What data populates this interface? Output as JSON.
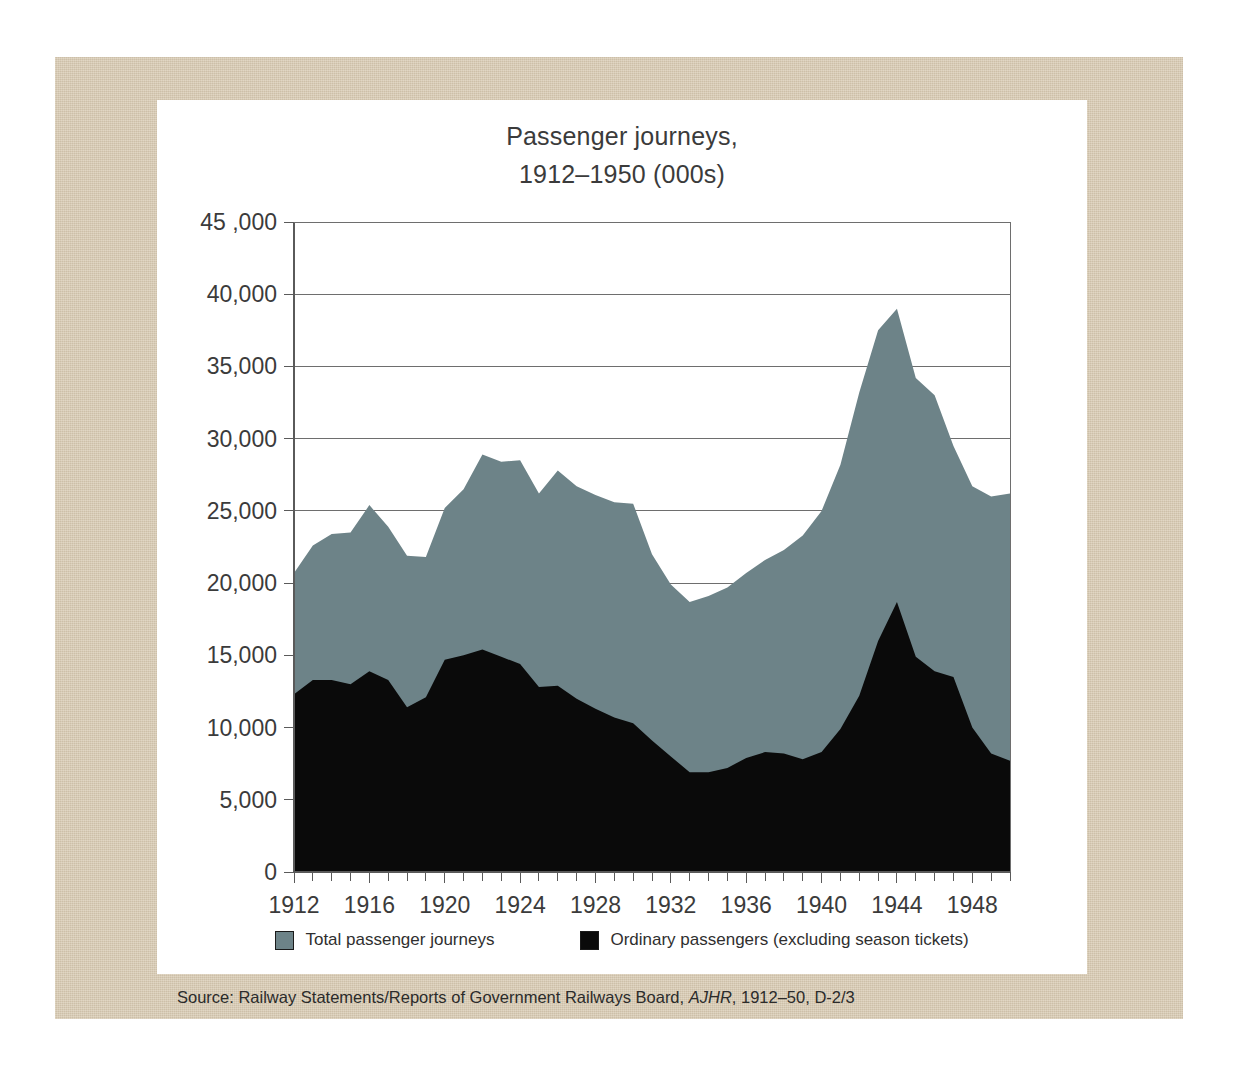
{
  "title": {
    "line1": "Passenger journeys,",
    "line2": "1912–1950 (000s)"
  },
  "source": {
    "prefix": "Source: Railway Statements/Reports of Government Railways Board, ",
    "italic": "AJHR",
    "suffix": ", 1912–50, D-2/3"
  },
  "legend": {
    "total": "Total passenger journeys",
    "ordinary": "Ordinary passengers (excluding season tickets)"
  },
  "colors": {
    "total": "#6d8388",
    "ordinary": "#0a0a0a",
    "mat": "#d9cbb3",
    "panel": "#ffffff",
    "axis": "#5a5a5a",
    "grid": "#6e6e6e",
    "text": "#3b3b3b"
  },
  "chart_data": {
    "type": "area",
    "title": "Passenger journeys, 1912–1950 (000s)",
    "xlabel": "",
    "ylabel": "",
    "units": "thousands of journeys",
    "stacked": false,
    "overlaid": true,
    "grid": true,
    "legend_position": "bottom",
    "xlim": [
      1912,
      1950
    ],
    "ylim": [
      0,
      45000
    ],
    "ytick_labels": [
      "0",
      "5,000",
      "10,000",
      "15,000",
      "20,000",
      "25,000",
      "30,000",
      "35,000",
      "40,000",
      "45 ,000"
    ],
    "yticks": [
      0,
      5000,
      10000,
      15000,
      20000,
      25000,
      30000,
      35000,
      40000,
      45000
    ],
    "xtick_labels": [
      "1912",
      "1916",
      "1920",
      "1924",
      "1928",
      "1932",
      "1936",
      "1940",
      "1944",
      "1948"
    ],
    "xticks": [
      1912,
      1916,
      1920,
      1924,
      1928,
      1932,
      1936,
      1940,
      1944,
      1948
    ],
    "xtick_minor_interval": 1,
    "x": [
      1912,
      1913,
      1914,
      1915,
      1916,
      1917,
      1918,
      1919,
      1920,
      1921,
      1922,
      1923,
      1924,
      1925,
      1926,
      1927,
      1928,
      1929,
      1930,
      1931,
      1932,
      1933,
      1934,
      1935,
      1936,
      1937,
      1938,
      1939,
      1940,
      1941,
      1942,
      1943,
      1944,
      1945,
      1946,
      1947,
      1948,
      1949,
      1950
    ],
    "series": [
      {
        "name": "Total passenger journeys",
        "color": "#6d8388",
        "values": [
          20700,
          22600,
          23400,
          23500,
          25400,
          23900,
          21900,
          21800,
          25200,
          26500,
          28900,
          28400,
          28500,
          26200,
          27800,
          26700,
          26100,
          25600,
          25500,
          22000,
          19900,
          18700,
          19100,
          19700,
          20700,
          21600,
          22300,
          23300,
          25000,
          28200,
          33200,
          37500,
          39000,
          34200,
          33000,
          29500,
          26700,
          26000,
          26200
        ]
      },
      {
        "name": "Ordinary passengers (excluding season tickets)",
        "color": "#0a0a0a",
        "values": [
          12300,
          13300,
          13300,
          13000,
          13900,
          13300,
          11400,
          12100,
          14700,
          15000,
          15400,
          14900,
          14400,
          12800,
          12900,
          12000,
          11300,
          10700,
          10300,
          9100,
          8000,
          6900,
          6900,
          7200,
          7900,
          8300,
          8200,
          7800,
          8300,
          9900,
          12200,
          16000,
          18700,
          14900,
          13900,
          13500,
          10000,
          8200,
          7700
        ]
      }
    ]
  }
}
